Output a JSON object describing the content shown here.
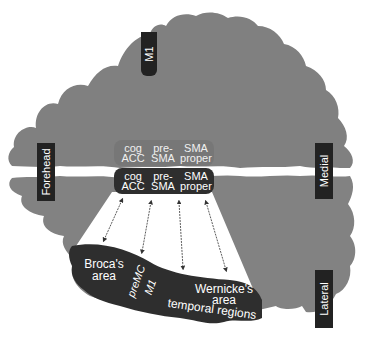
{
  "diagram": {
    "type": "brain-axial-slice",
    "colors": {
      "cortex": "#808080",
      "dark_region": "#2e2e2e",
      "label_bg": "#222222",
      "background": "#ffffff",
      "arrow": "#333333"
    },
    "orientation_labels": {
      "top": "M1",
      "left": "Forehead",
      "right_upper": "Medial",
      "right_lower": "Lateral"
    },
    "medial_regions_upper": [
      {
        "line1": "cog",
        "line2": "ACC"
      },
      {
        "line1": "pre-",
        "line2": "SMA"
      },
      {
        "line1": "SMA",
        "line2": "proper"
      }
    ],
    "medial_regions_lower": [
      {
        "line1": "cog",
        "line2": "ACC"
      },
      {
        "line1": "pre-",
        "line2": "SMA"
      },
      {
        "line1": "SMA",
        "line2": "proper"
      }
    ],
    "lateral_regions": {
      "broca_line1": "Broca's",
      "broca_line2": "area",
      "premc": "preMC",
      "m1": "M1",
      "wernicke_line1": "Wernicke's",
      "wernicke_line2": "area",
      "temporal": "temporal regions"
    },
    "connections": [
      {
        "from": "cog ACC",
        "to": "Broca's area",
        "type": "bidirectional"
      },
      {
        "from": "pre-SMA",
        "to": "preMC",
        "type": "bidirectional"
      },
      {
        "from": "pre-SMA/SMA proper",
        "to": "M1",
        "type": "bidirectional"
      },
      {
        "from": "SMA proper",
        "to": "Wernicke's area / temporal regions",
        "type": "bidirectional"
      }
    ]
  }
}
